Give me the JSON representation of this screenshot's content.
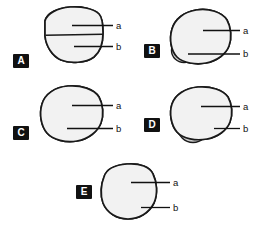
{
  "figure": {
    "title": "",
    "background_color": "#ffffff",
    "outline_color": "#1a1a1a",
    "fill_a_color": "#f2f2f2",
    "fill_b_color": "#cccccc",
    "badge_bg_color": "#111111",
    "badge_text_color": "#ffffff",
    "leader_color": "#111111",
    "panels": [
      {
        "id": "A",
        "badge_label": "A",
        "callouts": [
          {
            "key": "a",
            "label": "a",
            "target": "upper-region"
          },
          {
            "key": "b",
            "label": "b",
            "target": "lower-hatched-region"
          }
        ],
        "shape_note": "rounded quadrilateral outline divided by a horizontal line; lower half shaded with vertical hatching"
      },
      {
        "id": "B",
        "badge_label": "B",
        "callouts": [
          {
            "key": "a",
            "label": "a",
            "target": "outer-region"
          },
          {
            "key": "b",
            "label": "b",
            "target": "lower-left-circular-region"
          }
        ],
        "shape_note": "rounded triangular outline with a small shaded circle at the lower-left margin"
      },
      {
        "id": "C",
        "badge_label": "C",
        "callouts": [
          {
            "key": "a",
            "label": "a",
            "target": "outer-region"
          },
          {
            "key": "b",
            "label": "b",
            "target": "bottom-cup-region"
          }
        ],
        "shape_note": "rounded triangular outline with a shaded rounded-rectangular cup seated on the bottom edge"
      },
      {
        "id": "D",
        "badge_label": "D",
        "callouts": [
          {
            "key": "a",
            "label": "a",
            "target": "outer-region"
          },
          {
            "key": "b",
            "label": "b",
            "target": "protruding-circular-region"
          }
        ],
        "shape_note": "rounded triangular outline with a large shaded circle protruding past the bottom edge"
      },
      {
        "id": "E",
        "badge_label": "E",
        "callouts": [
          {
            "key": "a",
            "label": "a",
            "target": "outer-region"
          },
          {
            "key": "b",
            "label": "b",
            "target": "crescent-region"
          }
        ],
        "shape_note": "near-circular outline with flattened top containing a thick upward-opening shaded crescent"
      }
    ]
  }
}
